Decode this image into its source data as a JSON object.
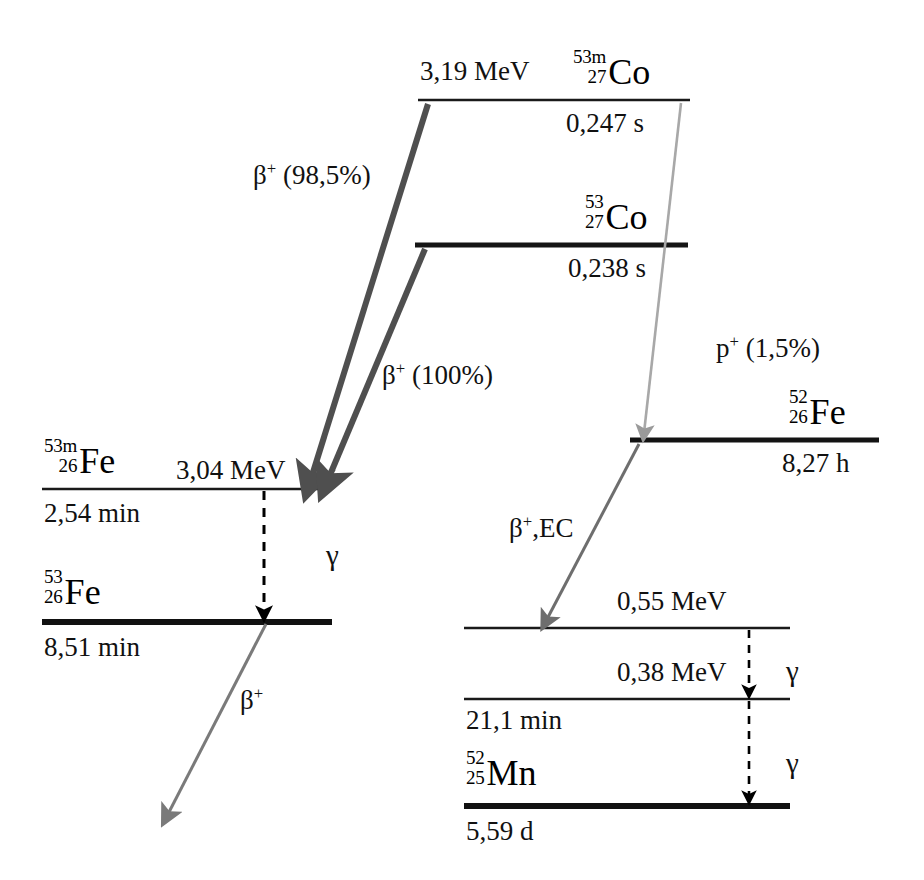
{
  "diagram": {
    "colors": {
      "level_line": "#111111",
      "beta_arrow_strong": "#4f4f4f",
      "arrow_gray": "#8c8c8c",
      "arrow_dark_gray": "#6e6e6e",
      "gamma_dashed": "#000000",
      "background": "#ffffff"
    }
  },
  "levels": {
    "co53m": {
      "nuclide_mass": "53m",
      "nuclide_number": "27",
      "nuclide_symbol": "Co",
      "energy": "3,19 MeV",
      "halflife": "0,247 s"
    },
    "co53": {
      "nuclide_mass": "53",
      "nuclide_number": "27",
      "nuclide_symbol": "Co",
      "energy": "",
      "halflife": "0,238 s"
    },
    "fe53m": {
      "nuclide_mass": "53m",
      "nuclide_number": "26",
      "nuclide_symbol": "Fe",
      "energy": "3,04 MeV",
      "halflife": "2,54 min"
    },
    "fe53": {
      "nuclide_mass": "53",
      "nuclide_number": "26",
      "nuclide_symbol": "Fe",
      "energy": "",
      "halflife": "8,51 min"
    },
    "fe52": {
      "nuclide_mass": "52",
      "nuclide_number": "26",
      "nuclide_symbol": "Fe",
      "energy": "",
      "halflife": "8,27 h"
    },
    "mn52_055": {
      "energy": "0,55 MeV",
      "halflife": ""
    },
    "mn52_038": {
      "energy": "0,38 MeV",
      "halflife": "21,1 min"
    },
    "mn52": {
      "nuclide_mass": "52",
      "nuclide_number": "25",
      "nuclide_symbol": "Mn",
      "energy": "",
      "halflife": "5,59 d"
    }
  },
  "transitions": {
    "beta_985": {
      "particle": "β",
      "charge": "+",
      "branch": " (98,5%)"
    },
    "beta_100": {
      "particle": "β",
      "charge": "+",
      "branch": " (100%)"
    },
    "proton_15": {
      "particle": "p",
      "charge": "+",
      "branch": " (1,5%)"
    },
    "beta_ec": {
      "particle": "β",
      "charge": "+",
      "branch": ",EC"
    },
    "beta_fe53": {
      "particle": "β",
      "charge": "+",
      "branch": ""
    },
    "gamma_fe": "γ",
    "gamma_mn_upper": "γ",
    "gamma_mn_lower": "γ"
  }
}
